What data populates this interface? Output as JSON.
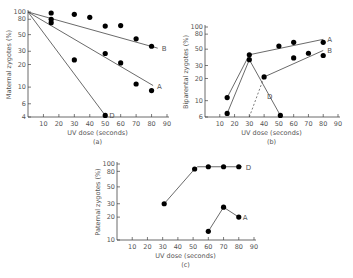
{
  "chart_data": [
    {
      "id": "a",
      "type": "line",
      "caption": "(a)",
      "title": "",
      "xlabel": "UV dose (seconds)",
      "ylabel": "Maternal zygotes (%)",
      "yscale": "log",
      "xlim": [
        0,
        90
      ],
      "ylim": [
        4,
        100
      ],
      "xticks": [
        10,
        20,
        30,
        40,
        50,
        60,
        70,
        80,
        90
      ],
      "yticks": [
        100,
        80,
        50,
        30,
        20,
        10,
        6,
        4
      ],
      "grid": false,
      "series": [
        {
          "name": "B",
          "points": [
            [
              0,
              100
            ],
            [
              15,
              97
            ],
            [
              30,
              93
            ],
            [
              40,
              85
            ],
            [
              50,
              65
            ],
            [
              60,
              66
            ],
            [
              70,
              44
            ],
            [
              80,
              35
            ]
          ],
          "fit": [
            [
              0,
              100
            ],
            [
              84,
              33
            ]
          ]
        },
        {
          "name": "A",
          "points": [
            [
              0,
              100
            ],
            [
              15,
              80
            ],
            [
              50,
              28
            ],
            [
              60,
              21
            ],
            [
              70,
              11
            ],
            [
              80,
              9
            ]
          ],
          "fit": [
            [
              0,
              100
            ],
            [
              81,
              10.5
            ]
          ]
        },
        {
          "name": "D",
          "points": [
            [
              0,
              100
            ],
            [
              15,
              72
            ],
            [
              30,
              23
            ],
            [
              50,
              4.2
            ]
          ],
          "fit": [
            [
              0,
              100
            ],
            [
              50,
              4.2
            ]
          ]
        }
      ]
    },
    {
      "id": "b",
      "type": "line",
      "caption": "(b)",
      "title": "",
      "xlabel": "UV dose (seconds)",
      "ylabel": "Biparental zygotes (%)",
      "yscale": "log",
      "xlim": [
        0,
        90
      ],
      "ylim": [
        6,
        100
      ],
      "xticks": [
        10,
        20,
        30,
        40,
        50,
        60,
        70,
        80,
        90
      ],
      "yticks": [
        100,
        80,
        50,
        30,
        20,
        10,
        6
      ],
      "grid": false,
      "series": [
        {
          "name": "A",
          "points": [
            [
              15,
              11
            ],
            [
              30,
              42
            ],
            [
              50,
              55
            ],
            [
              60,
              62
            ],
            [
              80,
              62
            ]
          ],
          "lines": [
            [
              [
                15,
                11
              ],
              [
                30,
                42
              ]
            ],
            [
              [
                30,
                42
              ],
              [
                80,
                68
              ]
            ]
          ]
        },
        {
          "name": "B",
          "points": [
            [
              40,
              21
            ],
            [
              60,
              38
            ],
            [
              70,
              44
            ],
            [
              80,
              41
            ]
          ],
          "lines": [
            [
              [
                40,
                21
              ],
              [
                80,
                48
              ]
            ]
          ],
          "dashed": [
            [
              [
                30,
                6
              ],
              [
                40,
                21
              ]
            ]
          ]
        },
        {
          "name": "D",
          "points": [
            [
              15,
              6.7
            ],
            [
              30,
              36
            ],
            [
              51,
              6.3
            ]
          ],
          "lines": [
            [
              [
                15,
                6.7
              ],
              [
                30,
                36
              ]
            ],
            [
              [
                30,
                36
              ],
              [
                51,
                6.3
              ]
            ]
          ]
        }
      ]
    },
    {
      "id": "c",
      "type": "line",
      "caption": "(c)",
      "title": "",
      "xlabel": "UV dose (seconds)",
      "ylabel": "Paternal zygotes (%)",
      "yscale": "log",
      "xlim": [
        0,
        90
      ],
      "ylim": [
        10,
        100
      ],
      "xticks": [
        10,
        20,
        30,
        40,
        50,
        60,
        70,
        80,
        90
      ],
      "yticks": [
        100,
        80,
        50,
        30,
        20,
        10
      ],
      "grid": false,
      "series": [
        {
          "name": "D",
          "points": [
            [
              31,
              30
            ],
            [
              51,
              86
            ],
            [
              60,
              92
            ],
            [
              70,
              92
            ],
            [
              80,
              92
            ]
          ],
          "lines": [
            [
              [
                31,
                30
              ],
              [
                51,
                86
              ]
            ],
            [
              [
                51,
                86
              ],
              [
                53,
                92
              ]
            ],
            [
              [
                53,
                92
              ],
              [
                82,
                92
              ]
            ]
          ]
        },
        {
          "name": "A",
          "points": [
            [
              60,
              13
            ],
            [
              70,
              27
            ],
            [
              80,
              20
            ]
          ],
          "lines": [
            [
              [
                60,
                13
              ],
              [
                70,
                27
              ]
            ],
            [
              [
                70,
                27
              ],
              [
                80,
                20
              ]
            ]
          ]
        }
      ]
    }
  ],
  "layout": {
    "a": {
      "ox": 28,
      "x90": 167,
      "y100": 12,
      "ybottom": 117,
      "ymin": 4,
      "label_x": [
        0.5,
        0.0
      ]
    },
    "b": {
      "ox": 205,
      "x90": 338,
      "y100": 27,
      "ybottom": 117,
      "ymin": 6
    },
    "c": {
      "ox": 117,
      "x90": 254,
      "y100": 164,
      "ybottom": 240,
      "ymin": 10
    }
  }
}
